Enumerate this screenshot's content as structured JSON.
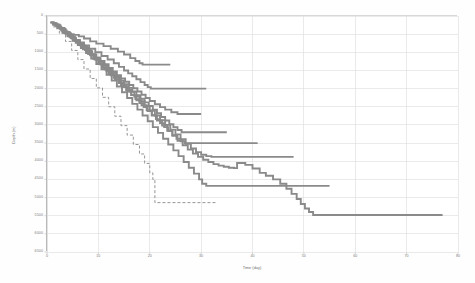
{
  "chart_data": {
    "type": "line",
    "title": "",
    "subtitle": "",
    "xlabel": "Time (day)",
    "ylabel": "Depth (m)",
    "xlim": [
      0,
      80
    ],
    "ylim": [
      0,
      6500
    ],
    "y_inverted": true,
    "grid": true,
    "legend": false,
    "legend_position": "none",
    "line_color": "#8a8a8a",
    "grid_color": "#dcdcdc",
    "axis_color": "#b9b9b9",
    "xticks": [
      0,
      10,
      20,
      30,
      40,
      50,
      60,
      70,
      80
    ],
    "xticklabels": [
      "0",
      "10",
      "20",
      "30",
      "40",
      "50",
      "60",
      "70",
      "80"
    ],
    "yticks": [
      0,
      500,
      1000,
      1500,
      2000,
      2500,
      3000,
      3500,
      4000,
      4500,
      5000,
      5500,
      6000,
      6500
    ],
    "yticklabels": [
      "0",
      "500",
      "1000",
      "1500",
      "2000",
      "2500",
      "3000",
      "3500",
      "4000",
      "4500",
      "5000",
      "5500",
      "6000",
      "6500"
    ],
    "series": [
      {
        "name": "well-1",
        "style": "step",
        "x": [
          0.6,
          1.1,
          1.4,
          1.8,
          2.0,
          2.4,
          2.6,
          3.0,
          3.4,
          4.0,
          4.6,
          5.2,
          6.2,
          7.2,
          8.4,
          9.6,
          11.0,
          12.4,
          13.8,
          15.0,
          16.2,
          17.2,
          18.0,
          18.6,
          24.0
        ],
        "y": [
          180,
          200,
          230,
          230,
          260,
          300,
          330,
          400,
          430,
          480,
          500,
          520,
          560,
          620,
          700,
          760,
          830,
          900,
          980,
          1060,
          1160,
          1240,
          1300,
          1340,
          1340
        ]
      },
      {
        "name": "well-2",
        "style": "step",
        "x": [
          0.8,
          1.3,
          1.8,
          2.2,
          2.6,
          3.2,
          3.8,
          4.4,
          5.0,
          5.6,
          6.4,
          7.2,
          8.2,
          9.4,
          10.6,
          11.8,
          13.0,
          14.0,
          15.0,
          15.8,
          16.6,
          17.4,
          18.2,
          19.0,
          19.6,
          20.2,
          24.0,
          31.0
        ],
        "y": [
          170,
          210,
          250,
          280,
          330,
          400,
          470,
          540,
          600,
          660,
          730,
          810,
          900,
          1000,
          1100,
          1200,
          1300,
          1400,
          1500,
          1580,
          1660,
          1740,
          1820,
          1900,
          1960,
          2000,
          2000,
          2000
        ]
      },
      {
        "name": "well-3",
        "style": "step",
        "x": [
          0.9,
          1.6,
          2.2,
          2.8,
          3.4,
          4.0,
          4.8,
          5.6,
          6.4,
          7.2,
          8.0,
          8.8,
          9.6,
          10.4,
          11.2,
          12.0,
          12.8,
          13.6,
          14.4,
          15.2,
          16.0,
          16.8,
          17.6,
          18.4,
          19.2,
          20.0,
          21.0,
          22.0,
          23.0,
          24.2,
          25.4,
          26.0,
          30.0
        ],
        "y": [
          190,
          260,
          330,
          400,
          470,
          540,
          620,
          700,
          790,
          880,
          970,
          1060,
          1150,
          1240,
          1330,
          1430,
          1530,
          1630,
          1720,
          1810,
          1900,
          1990,
          2080,
          2170,
          2260,
          2340,
          2430,
          2510,
          2580,
          2650,
          2700,
          2700,
          2700
        ]
      },
      {
        "name": "well-4",
        "style": "step",
        "x": [
          1.0,
          1.8,
          2.6,
          3.2,
          3.8,
          4.6,
          5.4,
          6.2,
          7.0,
          7.8,
          8.6,
          9.4,
          10.2,
          11.0,
          11.8,
          12.6,
          13.4,
          14.2,
          15.0,
          15.8,
          16.6,
          17.4,
          18.2,
          19.0,
          19.8,
          20.6,
          21.4,
          22.2,
          23.0,
          23.8,
          24.6,
          25.4,
          26.2,
          27.0,
          35.0
        ],
        "y": [
          200,
          280,
          360,
          420,
          490,
          580,
          670,
          760,
          850,
          950,
          1050,
          1150,
          1250,
          1350,
          1450,
          1560,
          1670,
          1780,
          1880,
          1980,
          2080,
          2180,
          2280,
          2380,
          2480,
          2580,
          2680,
          2780,
          2880,
          2980,
          3060,
          3140,
          3200,
          3200,
          3200
        ]
      },
      {
        "name": "well-5",
        "style": "step",
        "x": [
          1.2,
          2.0,
          2.8,
          3.6,
          4.4,
          5.2,
          6.0,
          6.8,
          7.6,
          8.4,
          9.2,
          10.0,
          10.8,
          11.6,
          12.4,
          13.2,
          14.0,
          14.8,
          15.6,
          16.4,
          17.2,
          18.0,
          18.8,
          19.6,
          20.4,
          21.2,
          22.0,
          22.8,
          23.6,
          24.4,
          25.2,
          26.0,
          26.8,
          27.6,
          28.4,
          41.0
        ],
        "y": [
          210,
          300,
          390,
          480,
          570,
          670,
          770,
          870,
          970,
          1080,
          1190,
          1300,
          1410,
          1520,
          1630,
          1740,
          1850,
          1960,
          2070,
          2180,
          2290,
          2400,
          2510,
          2620,
          2730,
          2840,
          2950,
          3060,
          3170,
          3280,
          3380,
          3450,
          3500,
          3500,
          3500,
          3500
        ]
      },
      {
        "name": "well-6",
        "style": "step",
        "x": [
          1.0,
          2.0,
          3.0,
          4.0,
          5.0,
          6.0,
          7.0,
          8.0,
          9.0,
          10.0,
          11.0,
          12.0,
          13.0,
          14.0,
          15.0,
          16.0,
          17.0,
          18.0,
          19.0,
          20.0,
          21.0,
          22.0,
          23.0,
          24.0,
          25.0,
          26.0,
          27.0,
          28.0,
          29.0,
          30.0,
          31.0,
          32.0,
          48.0
        ],
        "y": [
          240,
          340,
          450,
          560,
          680,
          800,
          920,
          1050,
          1180,
          1310,
          1440,
          1570,
          1700,
          1830,
          1960,
          2090,
          2220,
          2350,
          2480,
          2610,
          2740,
          2870,
          3000,
          3130,
          3260,
          3390,
          3520,
          3650,
          3750,
          3820,
          3860,
          3880,
          3880
        ]
      },
      {
        "name": "well-7",
        "style": "step",
        "x": [
          1.4,
          2.4,
          3.4,
          4.4,
          5.4,
          6.4,
          7.4,
          8.4,
          9.4,
          10.4,
          11.4,
          12.4,
          13.4,
          14.4,
          15.4,
          16.4,
          17.4,
          18.4,
          19.4,
          20.4,
          21.4,
          22.4,
          23.4,
          24.4,
          25.4,
          26.4,
          27.4,
          28.4,
          29.4,
          30.4,
          31.4,
          32.4,
          33.4,
          34.4,
          35.4,
          36.4,
          37.0,
          38.6,
          40.0,
          41.4,
          42.6,
          44.0,
          45.4,
          46.6,
          47.6,
          48.6,
          49.4,
          50.2,
          51.0,
          51.8,
          77.0
        ],
        "y": [
          230,
          330,
          440,
          560,
          680,
          810,
          940,
          1070,
          1200,
          1340,
          1480,
          1620,
          1760,
          1900,
          2040,
          2180,
          2320,
          2460,
          2600,
          2740,
          2880,
          3020,
          3160,
          3300,
          3440,
          3560,
          3680,
          3790,
          3880,
          3960,
          4020,
          4080,
          4120,
          4150,
          4180,
          4190,
          4050,
          4100,
          4200,
          4320,
          4400,
          4500,
          4620,
          4760,
          4900,
          5040,
          5180,
          5300,
          5400,
          5480,
          5480
        ]
      },
      {
        "name": "well-8",
        "style": "step",
        "x": [
          1.6,
          2.6,
          3.6,
          4.6,
          5.6,
          6.6,
          7.6,
          8.6,
          9.6,
          10.6,
          11.6,
          12.6,
          13.6,
          14.6,
          15.6,
          16.6,
          17.6,
          18.6,
          19.6,
          20.6,
          21.6,
          22.6,
          23.6,
          24.6,
          25.6,
          26.6,
          27.6,
          28.6,
          29.6,
          30.2,
          31.0,
          55.0
        ],
        "y": [
          250,
          360,
          480,
          610,
          740,
          880,
          1020,
          1170,
          1320,
          1470,
          1620,
          1780,
          1940,
          2100,
          2260,
          2420,
          2580,
          2740,
          2900,
          3060,
          3220,
          3380,
          3540,
          3700,
          3860,
          4020,
          4180,
          4340,
          4500,
          4620,
          4680,
          4680
        ]
      },
      {
        "name": "well-9-dashed",
        "style": "step-dashed",
        "x": [
          1.2,
          2.4,
          3.6,
          4.8,
          6.0,
          7.2,
          8.4,
          9.6,
          10.8,
          12.0,
          13.2,
          14.4,
          15.6,
          16.8,
          18.0,
          19.0,
          20.0,
          20.6,
          21.0,
          33.0
        ],
        "y": [
          300,
          480,
          700,
          950,
          1200,
          1460,
          1720,
          1980,
          2240,
          2500,
          2760,
          3020,
          3280,
          3540,
          3800,
          4060,
          4320,
          4500,
          5140,
          5140
        ]
      }
    ]
  }
}
